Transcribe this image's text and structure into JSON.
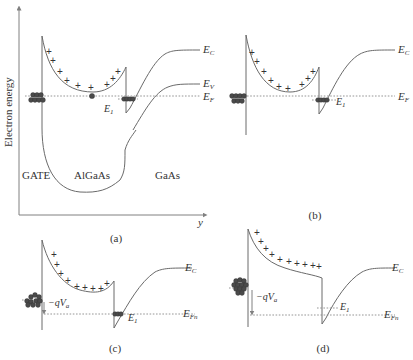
{
  "figure": {
    "y_axis_label": "Electron energy",
    "x_axis_label": "y",
    "panels": [
      {
        "id": "a",
        "caption": "(a)",
        "region_labels": [
          "GATE",
          "AlGaAs",
          "GaAs"
        ],
        "band_labels": {
          "ec": "E",
          "ec_sub": "C",
          "ev": "E",
          "ev_sub": "V",
          "ef": "E",
          "ef_sub": "F",
          "e1": "E",
          "e1_sub": "1"
        }
      },
      {
        "id": "b",
        "caption": "(b)",
        "band_labels": {
          "ec": "E",
          "ec_sub": "C",
          "ef": "E",
          "ef_sub": "F",
          "e1": "E",
          "e1_sub": "1"
        }
      },
      {
        "id": "c",
        "caption": "(c)",
        "band_labels": {
          "ec": "E",
          "ec_sub": "C",
          "efn": "E",
          "efn_sub": "Fn",
          "e1": "E",
          "e1_sub": "1"
        },
        "voltage_label": "−qV",
        "voltage_sub": "a"
      },
      {
        "id": "d",
        "caption": "(d)",
        "band_labels": {
          "ec": "E",
          "ec_sub": "C",
          "efn": "E",
          "efn_sub": "Fn",
          "e1": "E",
          "e1_sub": "1"
        },
        "voltage_label": "−qV",
        "voltage_sub": "a"
      }
    ],
    "symbols": {
      "donor": "+",
      "electron": "filled-circle"
    }
  }
}
